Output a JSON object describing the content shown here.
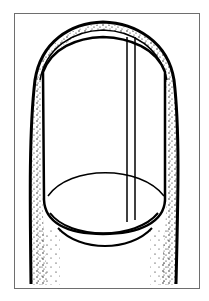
{
  "illustration": {
    "subject": "fingernail-with-longitudinal-line",
    "colors": {
      "background": "#ffffff",
      "ink": "#000000",
      "frame": "#6e6e6e"
    }
  }
}
